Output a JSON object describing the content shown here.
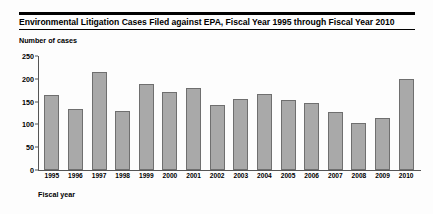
{
  "chart_data": {
    "type": "bar",
    "title": "Environmental Litigation Cases Filed against EPA, Fiscal Year 1995 through Fiscal Year 2010",
    "xlabel": "Fiscal year",
    "ylabel": "Number of cases",
    "categories": [
      "1995",
      "1996",
      "1997",
      "1998",
      "1999",
      "2000",
      "2001",
      "2002",
      "2003",
      "2004",
      "2005",
      "2006",
      "2007",
      "2008",
      "2009",
      "2010"
    ],
    "values": [
      165,
      133,
      215,
      130,
      188,
      170,
      180,
      143,
      155,
      167,
      153,
      148,
      128,
      103,
      115,
      200
    ],
    "ylim": [
      0,
      250
    ],
    "yticks": [
      "0",
      "50",
      "100",
      "150",
      "200",
      "250"
    ],
    "ytick_values": [
      0,
      50,
      100,
      150,
      200,
      250
    ],
    "grid": false,
    "legend": null,
    "bar_color": "#a9a9a9",
    "bar_border_color": "#6f6f6f",
    "axis_color": "#555555",
    "rule_color": "#000000"
  }
}
